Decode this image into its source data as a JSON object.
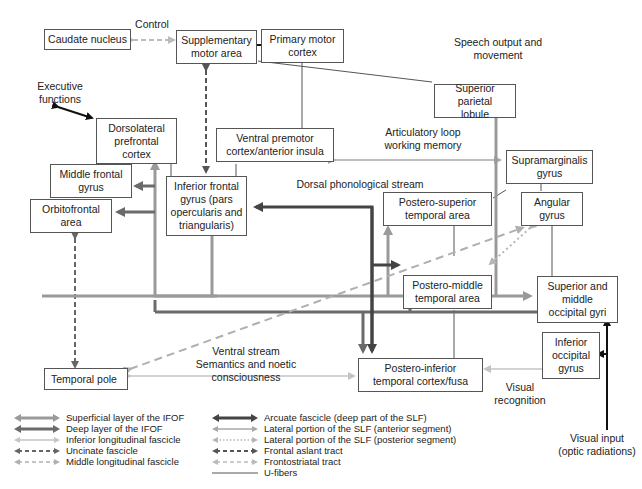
{
  "colors": {
    "superficial_ifof": "#9a9a9a",
    "deep_ifof": "#6b6b6b",
    "ilf": "#c4c4c4",
    "uncinate": "#666666",
    "mdlf": "#b0b0b0",
    "arcuate": "#444444",
    "slf_anterior": "#a8a8a8",
    "slf_posterior": "#b5b5b5",
    "fat": "#555555",
    "frontostriatal": "#bbbbbb",
    "ufibers": "#555555",
    "output": "#111111"
  },
  "nodes": {
    "caudate": {
      "label": "Caudate nucleus"
    },
    "sma": {
      "label": "Supplementary\nmotor area"
    },
    "pmc": {
      "label": "Primary motor\ncortex"
    },
    "spl": {
      "label": "Superior parietal\nlobule"
    },
    "dlpfc": {
      "label": "Dorsolateral\nprefrontal\ncortex"
    },
    "vpm": {
      "label": "Ventral premotor\ncortex/anterior insula"
    },
    "mfg": {
      "label": "Middle frontal\ngyrus"
    },
    "ofa": {
      "label": "Orbitofrontal\narea"
    },
    "ifg": {
      "label": "Inferior frontal\ngyrus (pars\nopercularis and\ntriangularis)"
    },
    "smg": {
      "label": "Supramarginalis\ngyrus"
    },
    "psta": {
      "label": "Postero-superior\ntemporal area"
    },
    "ag": {
      "label": "Angular\ngyrus"
    },
    "pmta": {
      "label": "Postero-middle\ntemporal area"
    },
    "smog": {
      "label": "Superior and\nmiddle\noccipital gyri"
    },
    "iog": {
      "label": "Inferior\noccipital\ngyrus"
    },
    "tp": {
      "label": "Temporal pole"
    },
    "pitc": {
      "label": "Postero-inferior\ntemporal cortex/fusa"
    }
  },
  "annotations": {
    "control": "Control",
    "speech_output": "Speech output and\nmovement",
    "executive": "Executive\nfunctions",
    "articulatory": "Articulatory loop\nworking memory",
    "dorsal_stream": "Dorsal phonological stream",
    "ventral_stream": "Ventral stream\nSemantics and noetic consciousness",
    "visual_recognition": "Visual\nrecognition",
    "visual_input": "Visual input\n(optic radiations)"
  },
  "legend": {
    "left": [
      {
        "key": "superficial_ifof",
        "label": "Superficial layer of the IFOF"
      },
      {
        "key": "deep_ifof",
        "label": "Deep layer of the IFOF"
      },
      {
        "key": "ilf",
        "label": "Inferior longitudinal fascicle"
      },
      {
        "key": "uncinate",
        "label": "Uncinate fascicle"
      },
      {
        "key": "mdlf",
        "label": "Middle longitudinal fascicle"
      }
    ],
    "right": [
      {
        "key": "arcuate",
        "label": "Arcuate fascicle (deep part of the SLF)"
      },
      {
        "key": "slf_anterior",
        "label": "Lateral portion of the SLF (anterior segment)"
      },
      {
        "key": "slf_posterior",
        "label": "Lateral portion of the SLF (posterior segment)"
      },
      {
        "key": "fat",
        "label": "Frontal aslant tract"
      },
      {
        "key": "frontostriatal",
        "label": "Frontostriatal tract"
      },
      {
        "key": "ufibers",
        "label": "U-fibers"
      }
    ]
  }
}
